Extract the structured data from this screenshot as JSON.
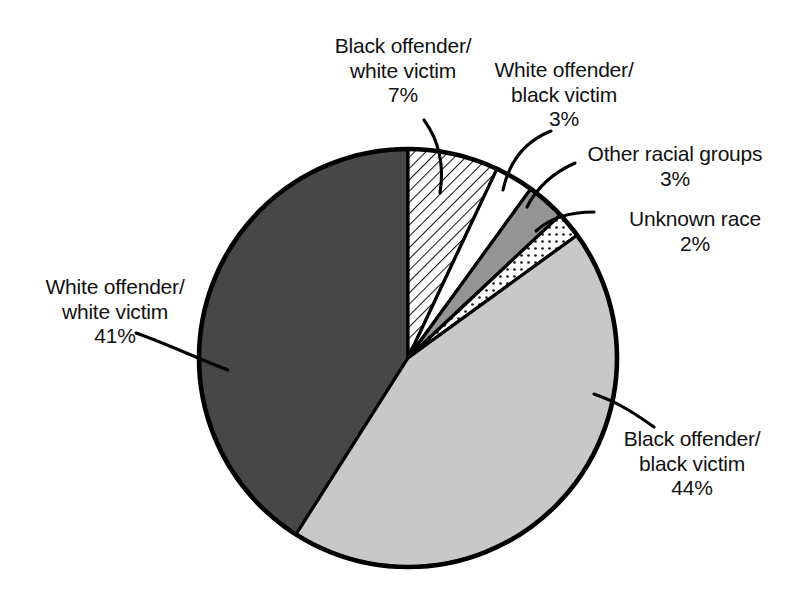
{
  "chart_data": {
    "type": "pie",
    "title": "",
    "subtitle": "",
    "xlabel": "",
    "ylabel": "",
    "legend_position": "none",
    "grid": false,
    "units": "percent",
    "total": 100,
    "start_angle_deg": 0,
    "direction": "clockwise",
    "categories": [
      "Black offender/white victim",
      "White offender/black victim",
      "Other racial groups",
      "Unknown race",
      "Black offender/black victim",
      "White offender/white victim"
    ],
    "values": [
      7,
      3,
      3,
      2,
      44,
      41
    ],
    "slices": [
      {
        "id": "black-offender-white-victim",
        "label_line1": "Black offender/",
        "label_line2": "white victim",
        "value": 7,
        "value_label": "7%",
        "fill": "#ffffff",
        "pattern": "diagonal-hatch",
        "stroke": "#000000"
      },
      {
        "id": "white-offender-black-victim",
        "label_line1": "White offender/",
        "label_line2": "black victim",
        "value": 3,
        "value_label": "3%",
        "fill": "#ffffff",
        "pattern": "solid",
        "stroke": "#000000"
      },
      {
        "id": "other-racial-groups",
        "label_line1": "Other racial groups",
        "label_line2": "",
        "value": 3,
        "value_label": "3%",
        "fill": "#949494",
        "pattern": "solid",
        "stroke": "#000000"
      },
      {
        "id": "unknown-race",
        "label_line1": "Unknown race",
        "label_line2": "",
        "value": 2,
        "value_label": "2%",
        "fill": "#ffffff",
        "pattern": "dots",
        "stroke": "#000000"
      },
      {
        "id": "black-offender-black-victim",
        "label_line1": "Black offender/",
        "label_line2": "black victim",
        "value": 44,
        "value_label": "44%",
        "fill": "#c8c8c8",
        "pattern": "solid",
        "stroke": "#000000"
      },
      {
        "id": "white-offender-white-victim",
        "label_line1": "White offender/",
        "label_line2": "white victim",
        "value": 41,
        "value_label": "41%",
        "fill": "#474747",
        "pattern": "solid",
        "stroke": "#000000"
      }
    ],
    "colors": {
      "dark_gray": "#474747",
      "light_gray": "#c8c8c8",
      "medium_gray": "#949494",
      "white": "#ffffff",
      "outline": "#000000",
      "text": "#111111",
      "background": "#ffffff"
    }
  }
}
